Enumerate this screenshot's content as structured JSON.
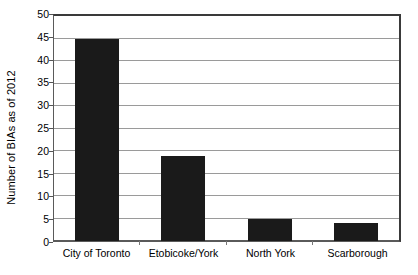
{
  "chart_data": {
    "type": "bar",
    "title": "",
    "subtitle": "",
    "xlabel": "",
    "ylabel": "Number of BIAs as of 2012",
    "categories": [
      "City of Toronto",
      "Etobicoke/York",
      "North York",
      "Scarborough"
    ],
    "values": [
      45,
      19,
      5,
      4
    ],
    "ylim": [
      0,
      50
    ],
    "ytick_step": 5,
    "yticks": [
      0,
      5,
      10,
      15,
      20,
      25,
      30,
      35,
      40,
      45,
      50
    ],
    "ytick_labels": [
      "0",
      "5",
      "10",
      "15",
      "20",
      "25",
      "30",
      "35",
      "40",
      "45",
      "50"
    ],
    "grid": true,
    "grid_axis": "y",
    "legend": false,
    "legend_position": "none",
    "bar_color": "#1a1a1a",
    "gridline_color": "#9a9a9a",
    "axis_color": "#3a3a3a",
    "background_color": "#ffffff"
  }
}
